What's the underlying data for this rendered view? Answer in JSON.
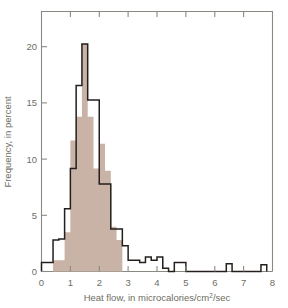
{
  "figure": {
    "background_color": "#ffffff",
    "frame_color": "#8a8a82",
    "outline_series_color": "#241f1c",
    "filled_series_color": "#c9b3a6"
  },
  "axes": {
    "x": {
      "label_prefix": "Heat flow, in microcalories/cm",
      "label_superscript": "2",
      "label_suffix": "/sec",
      "label_full": "Heat flow, in microcalories/cm2/sec",
      "ticks": [
        "0",
        "1",
        "2",
        "3",
        "4",
        "5",
        "6",
        "7",
        "8"
      ],
      "min": 0,
      "max": 8
    },
    "y": {
      "label": "Frequency, in percent",
      "ticks": [
        "0",
        "5",
        "10",
        "15",
        "20"
      ],
      "min": 0,
      "max": 23.2
    }
  },
  "chart_data": {
    "type": "bar",
    "title": "",
    "subtitle": "",
    "xlabel": "Heat flow, in microcalories/cm2/sec",
    "ylabel": "Frequency, in percent",
    "xlim": [
      0,
      8
    ],
    "ylim": [
      0,
      23.2
    ],
    "grid": false,
    "legend_position": "none",
    "bin_width": 0.2,
    "annotations": [],
    "series": [
      {
        "name": "Filled histogram (shaded)",
        "style": "filled",
        "color": "#c9b3a6",
        "bin_edges": [
          0.4,
          0.6,
          0.8,
          1.0,
          1.2,
          1.4,
          1.6,
          1.8,
          2.0,
          2.2,
          2.4,
          2.6,
          2.8
        ],
        "values": [
          1.0,
          1.0,
          3.5,
          11.7,
          13.8,
          20.3,
          13.8,
          9.2,
          11.4,
          9.0,
          4.0,
          2.8
        ]
      },
      {
        "name": "Outlined histogram (step)",
        "style": "step-outline",
        "color": "#241f1c",
        "bin_edges": [
          0.0,
          0.2,
          0.4,
          0.6,
          0.8,
          1.0,
          1.2,
          1.4,
          1.6,
          1.8,
          2.0,
          2.2,
          2.4,
          2.6,
          2.8,
          3.0,
          3.2,
          3.4,
          3.6,
          3.8,
          4.0,
          4.2,
          4.4,
          4.6,
          4.8,
          5.0,
          5.2,
          5.4,
          5.6,
          5.8,
          6.0,
          6.2,
          6.4,
          6.6,
          6.8,
          7.0,
          7.2,
          7.4,
          7.6,
          7.8
        ],
        "values": [
          0.8,
          0.8,
          2.8,
          2.9,
          5.6,
          9.2,
          16.6,
          20.3,
          15.3,
          15.3,
          7.8,
          7.8,
          3.8,
          3.8,
          2.3,
          1.0,
          1.0,
          0.8,
          1.3,
          1.0,
          1.3,
          0.3,
          0.0,
          0.8,
          0.8,
          0.0,
          0.0,
          0.0,
          0.0,
          0.0,
          0.0,
          0.0,
          0.7,
          0.0,
          0.0,
          0.0,
          0.0,
          0.0,
          0.6,
          0.0
        ]
      }
    ]
  }
}
